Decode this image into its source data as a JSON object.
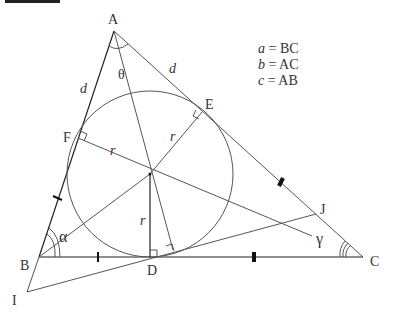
{
  "title_bar": "",
  "points": {
    "A": {
      "label": "A",
      "x": 114,
      "y": 31
    },
    "B": {
      "label": "B",
      "x": 39,
      "y": 257
    },
    "C": {
      "label": "C",
      "x": 363,
      "y": 257
    },
    "D": {
      "label": "D",
      "x": 153,
      "y": 257
    },
    "E": {
      "label": "E",
      "x": 202,
      "y": 112
    },
    "F": {
      "label": "F",
      "x": 78,
      "y": 138
    },
    "I": {
      "label": "I",
      "x": 27,
      "y": 292
    },
    "J": {
      "label": "J",
      "x": 316,
      "y": 214
    },
    "O": {
      "label": "",
      "x": 150,
      "y": 174
    }
  },
  "incircle": {
    "cx": 150,
    "cy": 174,
    "r": 83
  },
  "labels": {
    "theta": "θ",
    "alpha": "α",
    "gamma": "γ",
    "d_ab": "d",
    "d_ac": "d",
    "r_f": "r",
    "r_e": "r",
    "r_d": "r"
  },
  "legend": [
    {
      "var": "a",
      "eq": " = BC"
    },
    {
      "var": "b",
      "eq": " = AC"
    },
    {
      "var": "c",
      "eq": " = AB"
    }
  ]
}
